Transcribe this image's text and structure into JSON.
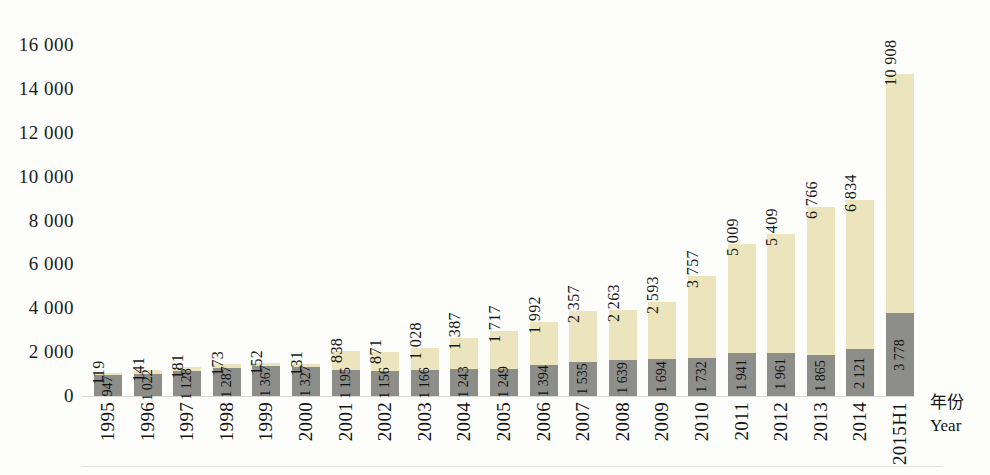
{
  "chart_data": {
    "type": "bar",
    "stacked": true,
    "title": "",
    "subtitle": "",
    "xlabel": "年份\nYear",
    "xlabel_cn": "年份",
    "xlabel_en": "Year",
    "ylabel": "",
    "ylim": [
      0,
      16000
    ],
    "ytick_values": [
      0,
      2000,
      4000,
      6000,
      8000,
      10000,
      12000,
      14000,
      16000
    ],
    "ytick_labels": [
      "0",
      "2 000",
      "4 000",
      "6 000",
      "8 000",
      "10 000",
      "12 000",
      "14 000",
      "16 000"
    ],
    "grid": false,
    "legend": null,
    "categories": [
      "1995",
      "1996",
      "1997",
      "1998",
      "1999",
      "2000",
      "2001",
      "2002",
      "2003",
      "2004",
      "2005",
      "2006",
      "2007",
      "2008",
      "2009",
      "2010",
      "2011",
      "2012",
      "2013",
      "2014",
      "2015H1"
    ],
    "series": [
      {
        "name": "lower",
        "color": "#8d8d8a",
        "values": [
          947,
          1022,
          1128,
          1287,
          1367,
          1327,
          1195,
          1156,
          1166,
          1243,
          1249,
          1394,
          1535,
          1639,
          1694,
          1732,
          1941,
          1961,
          1865,
          2121,
          3778
        ],
        "labels": [
          "947",
          "1 022",
          "1 128",
          "1 287",
          "1 367",
          "1 327",
          "1 195",
          "1 156",
          "1 166",
          "1 243",
          "1 249",
          "1 394",
          "1 535",
          "1 639",
          "1 694",
          "1 732",
          "1 941",
          "1 961",
          "1 865",
          "2 121",
          "3 778"
        ]
      },
      {
        "name": "upper",
        "color": "#ece4bd",
        "values": [
          119,
          141,
          181,
          173,
          152,
          131,
          838,
          871,
          1028,
          1387,
          1717,
          1992,
          2357,
          2263,
          2593,
          3757,
          5009,
          5409,
          6766,
          6834,
          10908
        ],
        "labels": [
          "119",
          "141",
          "181",
          "173",
          "152",
          "131",
          "838",
          "871",
          "1 028",
          "1 387",
          "1 717",
          "1 992",
          "2 357",
          "2 263",
          "2 593",
          "3 757",
          "5 009",
          "5 409",
          "6 766",
          "6 834",
          "10 908"
        ]
      }
    ]
  }
}
